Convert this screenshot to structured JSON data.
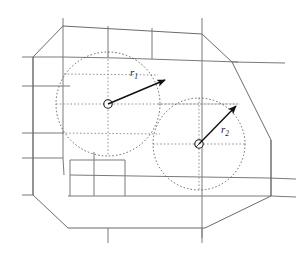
{
  "figure": {
    "type": "geometric-diagram",
    "canvas": {
      "width": 301,
      "height": 256,
      "background": "#ffffff"
    },
    "colors": {
      "polygon_stroke": "#6b6b6b",
      "grid_stroke": "#7a7a7a",
      "circle_stroke": "#555555",
      "arrow_stroke": "#111111",
      "label_fill": "#1a1a1a",
      "node_fill": "#ffffff"
    },
    "stroke_widths": {
      "polygon": 1.0,
      "grid": 1.0,
      "circle_dashed": 0.9,
      "arrow": 1.4
    },
    "boundary": {
      "name": "outer-polygon",
      "closed": true,
      "line_style": "solid",
      "vertices": [
        [
          63,
          26
        ],
        [
          202,
          34
        ],
        [
          232,
          62
        ],
        [
          271,
          140
        ],
        [
          271,
          196
        ],
        [
          205,
          228
        ],
        [
          68,
          228
        ],
        [
          33,
          195
        ],
        [
          33,
          57
        ]
      ]
    },
    "grid_lines": [
      {
        "name": "grid-h-1",
        "x1": 33,
        "y1": 57,
        "x2": 63,
        "y2": 57
      },
      {
        "name": "grid-h-2",
        "x1": 22,
        "y1": 57,
        "x2": 33,
        "y2": 57
      },
      {
        "name": "grid-h-3",
        "x1": 22,
        "y1": 86,
        "x2": 70,
        "y2": 86
      },
      {
        "name": "grid-h-4",
        "x1": 22,
        "y1": 133,
        "x2": 64,
        "y2": 133
      },
      {
        "name": "grid-h-5",
        "x1": 22,
        "y1": 158,
        "x2": 63,
        "y2": 158
      },
      {
        "name": "grid-h-6",
        "x1": 22,
        "y1": 195,
        "x2": 33,
        "y2": 195
      },
      {
        "name": "grid-h-7",
        "x1": 63,
        "y1": 57,
        "x2": 118,
        "y2": 58
      },
      {
        "name": "grid-h-8",
        "x1": 118,
        "y1": 58,
        "x2": 238,
        "y2": 62
      },
      {
        "name": "grid-h-9",
        "x1": 232,
        "y1": 62,
        "x2": 285,
        "y2": 63
      },
      {
        "name": "grid-h-10",
        "x1": 70,
        "y1": 175,
        "x2": 268,
        "y2": 178
      },
      {
        "name": "grid-h-11",
        "x1": 268,
        "y1": 178,
        "x2": 296,
        "y2": 179
      },
      {
        "name": "grid-h-12",
        "x1": 68,
        "y1": 196,
        "x2": 271,
        "y2": 196
      },
      {
        "name": "grid-h-13",
        "x1": 271,
        "y1": 196,
        "x2": 296,
        "y2": 197
      },
      {
        "name": "grid-v-1",
        "x1": 63,
        "y1": 18,
        "x2": 63,
        "y2": 158
      },
      {
        "name": "grid-v-2",
        "x1": 63,
        "y1": 158,
        "x2": 64,
        "y2": 175
      },
      {
        "name": "grid-v-3",
        "x1": 108,
        "y1": 26,
        "x2": 108,
        "y2": 57
      },
      {
        "name": "grid-v-4",
        "x1": 152,
        "y1": 28,
        "x2": 152,
        "y2": 59
      },
      {
        "name": "grid-v-5",
        "x1": 202,
        "y1": 18,
        "x2": 202,
        "y2": 238
      },
      {
        "name": "grid-v-6",
        "x1": 94,
        "y1": 175,
        "x2": 94,
        "y2": 196
      },
      {
        "name": "grid-v-7",
        "x1": 125,
        "y1": 160,
        "x2": 125,
        "y2": 196
      },
      {
        "name": "grid-v-8",
        "x1": 70,
        "y1": 160,
        "x2": 70,
        "y2": 196
      },
      {
        "name": "grid-v-9",
        "x1": 70,
        "y1": 160,
        "x2": 125,
        "y2": 160
      },
      {
        "name": "grid-v-10",
        "x1": 94,
        "y1": 152,
        "x2": 94,
        "y2": 175
      },
      {
        "name": "grid-v-11",
        "x1": 271,
        "y1": 140,
        "x2": 271,
        "y2": 196
      },
      {
        "name": "grid-v-12",
        "x1": 33,
        "y1": 57,
        "x2": 33,
        "y2": 195
      },
      {
        "name": "grid-v-13",
        "x1": 108,
        "y1": 228,
        "x2": 108,
        "y2": 243
      },
      {
        "name": "grid-v-14",
        "x1": 202,
        "y1": 228,
        "x2": 202,
        "y2": 243
      }
    ],
    "circles": [
      {
        "name": "coverage-circle-1",
        "center": [
          108,
          104
        ],
        "radius": 52,
        "line_style": "dotted",
        "label": "r1"
      },
      {
        "name": "coverage-circle-2",
        "center": [
          199,
          144
        ],
        "radius": 46,
        "line_style": "dotted",
        "label": "r2"
      }
    ],
    "inner_dotted_guides": [
      {
        "name": "guide-h-circle1",
        "x1": 56,
        "y1": 104,
        "x2": 240,
        "y2": 104
      },
      {
        "name": "guide-h-circle1-upper",
        "x1": 64,
        "y1": 74,
        "x2": 158,
        "y2": 75
      },
      {
        "name": "guide-h-circle1-lower",
        "x1": 62,
        "y1": 133,
        "x2": 160,
        "y2": 134
      },
      {
        "name": "guide-v-circle1",
        "x1": 108,
        "y1": 52,
        "x2": 108,
        "y2": 156
      },
      {
        "name": "guide-h-circle2",
        "x1": 153,
        "y1": 144,
        "x2": 245,
        "y2": 144
      },
      {
        "name": "guide-h-circle2-upper",
        "x1": 158,
        "y1": 104,
        "x2": 238,
        "y2": 104
      },
      {
        "name": "guide-v-circle2",
        "x1": 199,
        "y1": 98,
        "x2": 199,
        "y2": 190
      }
    ],
    "nodes": [
      {
        "name": "center-node-1",
        "cx": 108,
        "cy": 104,
        "r": 4.2
      },
      {
        "name": "center-node-2",
        "cx": 199,
        "cy": 144,
        "r": 4.2
      }
    ],
    "arrows": [
      {
        "name": "radius-arrow-1",
        "from": [
          108,
          104
        ],
        "to": [
          165,
          80
        ],
        "label": "r1",
        "label_pos": [
          132,
          74
        ]
      },
      {
        "name": "radius-arrow-2",
        "from": [
          199,
          144
        ],
        "to": [
          236,
          106
        ],
        "label": "r2",
        "label_pos": [
          224,
          131
        ]
      }
    ],
    "labels": [
      {
        "name": "radius-label-1",
        "base": "r",
        "subscript": "1",
        "x": 130,
        "y": 76
      },
      {
        "name": "radius-label-2",
        "base": "r",
        "subscript": "2",
        "x": 221,
        "y": 133
      }
    ]
  }
}
